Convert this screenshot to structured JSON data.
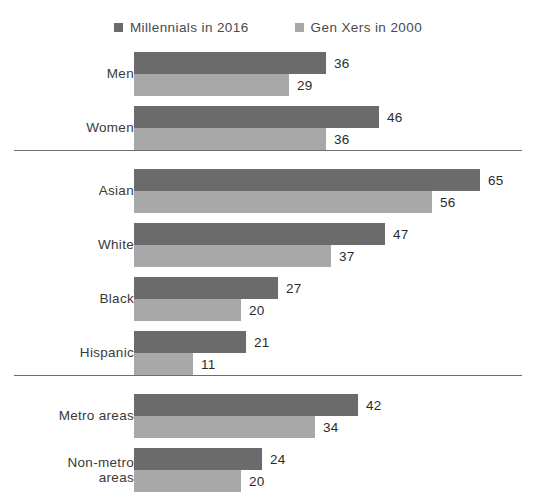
{
  "chart_data": {
    "type": "bar",
    "orientation": "horizontal",
    "title": "",
    "subtitle": "",
    "xlabel": "",
    "ylabel": "",
    "xlim": [
      0,
      65
    ],
    "grid": false,
    "legend_position": "top-center",
    "categories": [
      "Men",
      "Women",
      "Asian",
      "White",
      "Black",
      "Hispanic",
      "Metro areas",
      "Non-metro areas"
    ],
    "series": [
      {
        "name": "Millennials in 2016",
        "color": "#6b6b6b",
        "values": [
          36,
          46,
          65,
          47,
          27,
          21,
          42,
          24
        ]
      },
      {
        "name": "Gen Xers in 2000",
        "color": "#a8a8a8",
        "values": [
          29,
          36,
          56,
          37,
          20,
          11,
          34,
          20
        ]
      }
    ],
    "groups": [
      {
        "name": "gender",
        "categories": [
          "Men",
          "Women"
        ]
      },
      {
        "name": "race-ethnicity",
        "categories": [
          "Asian",
          "White",
          "Black",
          "Hispanic"
        ]
      },
      {
        "name": "geography",
        "categories": [
          "Metro areas",
          "Non-metro areas"
        ]
      }
    ]
  },
  "legend": {
    "entries": [
      {
        "label": "Millennials in 2016",
        "swatch": "legend-swatch-millennials",
        "color": "#6b6b6b"
      },
      {
        "label": "Gen Xers in 2000",
        "swatch": "legend-swatch-genxers",
        "color": "#a8a8a8"
      }
    ]
  },
  "rows": [
    {
      "label": "Men",
      "label_line2": "",
      "dark": 36,
      "light": 29
    },
    {
      "label": "Women",
      "label_line2": "",
      "dark": 46,
      "light": 36
    },
    {
      "label": "Asian",
      "label_line2": "",
      "dark": 65,
      "light": 56
    },
    {
      "label": "White",
      "label_line2": "",
      "dark": 47,
      "light": 37
    },
    {
      "label": "Black",
      "label_line2": "",
      "dark": 27,
      "light": 20
    },
    {
      "label": "Hispanic",
      "label_line2": "",
      "dark": 21,
      "light": 11
    },
    {
      "label": "Metro areas",
      "label_line2": "",
      "dark": 42,
      "light": 34
    },
    {
      "label": "Non-metro",
      "label_line2": "areas",
      "dark": 24,
      "light": 20
    }
  ],
  "colors": {
    "series_dark": "#6b6b6b",
    "series_light": "#a8a8a8",
    "separator": "#6e6e6e",
    "background": "#ffffff"
  }
}
